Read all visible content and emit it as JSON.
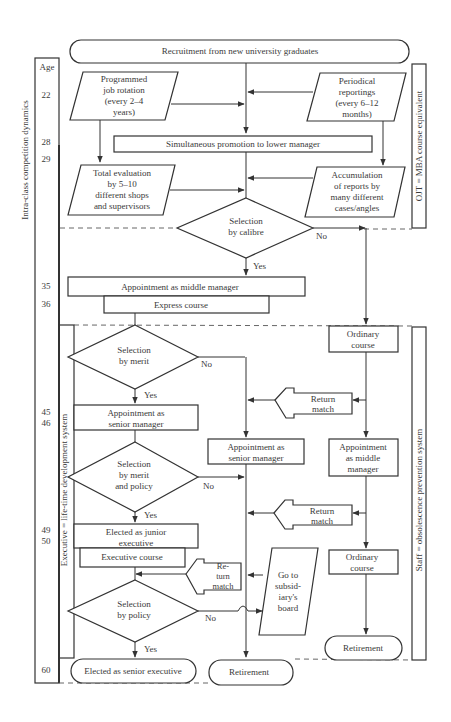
{
  "diagram": {
    "start": "Recruitment from new university graduates",
    "age_column": {
      "header": "Age",
      "ages": [
        "22",
        "28",
        "29",
        "35",
        "36",
        "45",
        "46",
        "49",
        "50",
        "60"
      ]
    },
    "side_labels": {
      "left_outer": "Intra-class competition dynamics",
      "left_inner": "Executive = life-time development system",
      "right_top": "OJT = MBA course equivalent",
      "right_bottom": "Staff = obsolescence prevention system"
    },
    "nodes": {
      "job_rotation": [
        "Programmed",
        "job rotation",
        "(every 2–4",
        "years)"
      ],
      "periodical_reportings": [
        "Periodical",
        "reportings",
        "(every 6–12",
        "months)"
      ],
      "simultaneous_promotion": "Simultaneous promotion to lower manager",
      "total_evaluation": [
        "Total evaluation",
        "by 5–10",
        "different shops",
        "and supervisors"
      ],
      "accumulation": [
        "Accumulation",
        "of reports by",
        "many different",
        "cases/angles"
      ],
      "selection_calibre": [
        "Selection",
        "by calibre"
      ],
      "appointment_middle_manager": "Appointment as middle manager",
      "express_course": "Express course",
      "ordinary_course_1": [
        "Ordinary",
        "course"
      ],
      "selection_merit": [
        "Selection",
        "by merit"
      ],
      "appointment_senior_left": [
        "Appointment as",
        "senior manager"
      ],
      "appointment_senior_mid": [
        "Appointment as",
        "senior manager"
      ],
      "appointment_middle_right": [
        "Appointment",
        "as middle",
        "manager"
      ],
      "return_match_1": [
        "Return",
        "match"
      ],
      "selection_merit_policy": [
        "Selection",
        "by merit",
        "and policy"
      ],
      "return_match_2": [
        "Return",
        "match"
      ],
      "elected_junior": [
        "Elected as junior",
        "executive"
      ],
      "executive_course": "Executive course",
      "ordinary_course_2": [
        "Ordinary",
        "course"
      ],
      "return_match_3": [
        "Re-",
        "turn",
        "match"
      ],
      "subsidiary_board": [
        "Go to",
        "subsid-",
        "iary's",
        "board"
      ],
      "selection_policy": [
        "Selection",
        "by policy"
      ],
      "retirement_right": "Retirement",
      "elected_senior": "Elected as senior executive",
      "retirement_mid": "Retirement"
    },
    "edge_labels": {
      "yes": "Yes",
      "no": "No"
    }
  }
}
